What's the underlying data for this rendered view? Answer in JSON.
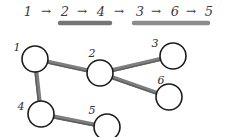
{
  "diagram": {
    "background_color": "#ffffff"
  },
  "sequence": {
    "name": "traversal-sequence",
    "arrow_glyph": "→",
    "steps": [
      {
        "label": "1",
        "x": 28,
        "y": 16
      },
      {
        "label": "2",
        "x": 65,
        "y": 16
      },
      {
        "label": "4",
        "x": 101,
        "y": 16
      },
      {
        "label": "3",
        "x": 140,
        "y": 16
      },
      {
        "label": "6",
        "x": 175,
        "y": 16
      },
      {
        "label": "5",
        "x": 209,
        "y": 16
      }
    ],
    "arrows": [
      {
        "x": 46,
        "y": 15
      },
      {
        "x": 82,
        "y": 15
      },
      {
        "x": 119,
        "y": 15
      },
      {
        "x": 156,
        "y": 15
      },
      {
        "x": 191,
        "y": 15
      }
    ],
    "highlight_bars": [
      {
        "name": "highlight-bar-left",
        "covers": "2 → 4",
        "x1": 60,
        "x2": 110,
        "y": 23,
        "color": "#757575",
        "thickness": 4.5
      },
      {
        "name": "highlight-bar-right",
        "covers": "3 → 6 → 5",
        "x1": 134,
        "x2": 208,
        "y": 23,
        "color": "#8c8c8c",
        "thickness": 4.5
      }
    ]
  },
  "graph": {
    "name": "node-link-graph",
    "node_radius": 13,
    "node_fill": "#ffffff",
    "node_stroke": "#1c1c1c",
    "edge_color": "#7e7e7e",
    "nodes": [
      {
        "id": "1",
        "label": "1",
        "cx": 35,
        "cy": 59,
        "label_x": 17,
        "label_y": 51
      },
      {
        "id": "2",
        "label": "2",
        "cx": 100,
        "cy": 73,
        "label_x": 92,
        "label_y": 57
      },
      {
        "id": "3",
        "label": "3",
        "cx": 173,
        "cy": 56,
        "label_x": 155,
        "label_y": 47
      },
      {
        "id": "4",
        "label": "4",
        "cx": 41,
        "cy": 114,
        "label_x": 21,
        "label_y": 110
      },
      {
        "id": "5",
        "label": "5",
        "cx": 107,
        "cy": 127,
        "label_x": 92,
        "label_y": 114
      },
      {
        "id": "6",
        "label": "6",
        "cx": 169,
        "cy": 97,
        "label_x": 161,
        "label_y": 84
      }
    ],
    "edges": [
      {
        "from": "1",
        "to": "2",
        "name": "edge-1-2"
      },
      {
        "from": "1",
        "to": "4",
        "name": "edge-1-4"
      },
      {
        "from": "2",
        "to": "3",
        "name": "edge-2-3"
      },
      {
        "from": "2",
        "to": "6",
        "name": "edge-2-6"
      },
      {
        "from": "4",
        "to": "5",
        "name": "edge-4-5"
      }
    ]
  }
}
